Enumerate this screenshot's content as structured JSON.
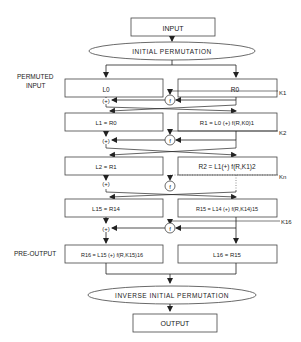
{
  "diagram": {
    "input_label": "INPUT",
    "initial_permutation": "INITIAL PERMUTATION",
    "permuted_input_label_line1": "PERMUTED",
    "permuted_input_label_line2": "INPUT",
    "round0": {
      "left": "L0",
      "right": "R0",
      "key": "K1"
    },
    "round1": {
      "left": "L1 = R0",
      "right": "R1 = L0 (+) f(R,K0)1",
      "key": "K2"
    },
    "round2": {
      "left": "L2 = R1",
      "right": "R2 = L1(+) f(R,K1)2",
      "key": "Kn"
    },
    "round15": {
      "left": "L15 = R14",
      "right": "R15 = L14 (+) f(R,K14)15",
      "key": "K16"
    },
    "pre_output_label": "PRE-OUTPUT",
    "round16": {
      "left": "R16 = L15 (+) f(R,K15)16",
      "right": "L16 = R15"
    },
    "xor_symbol": "(+)",
    "f_symbol": "f",
    "inverse_permutation": "INVERSE INITIAL PERMUTATION",
    "output_label": "OUTPUT"
  }
}
